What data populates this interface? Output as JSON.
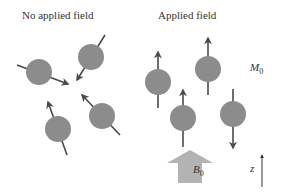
{
  "left_panel": {
    "title": "No applied field",
    "spins": [
      {
        "cx": 39,
        "cy": 72,
        "x1": 17,
        "y1": 65,
        "x2": 68,
        "y2": 84
      },
      {
        "cx": 91,
        "cy": 57,
        "x1": 105,
        "y1": 35,
        "x2": 77,
        "y2": 80
      },
      {
        "cx": 58,
        "cy": 129,
        "x1": 67,
        "y1": 155,
        "x2": 48,
        "y2": 102
      },
      {
        "cx": 102,
        "cy": 116,
        "x1": 120,
        "y1": 135,
        "x2": 82,
        "y2": 95
      }
    ]
  },
  "right_panel": {
    "title": "Applied field",
    "magnetization_label": "M",
    "magnetization_subscript": "0",
    "field_label": "B",
    "field_subscript": "0",
    "axis_label": "z",
    "spins": [
      {
        "cx": 158,
        "cy": 82,
        "x1": 158,
        "y1": 108,
        "x2": 158,
        "y2": 52
      },
      {
        "cx": 208,
        "cy": 69,
        "x1": 208,
        "y1": 95,
        "x2": 208,
        "y2": 38
      },
      {
        "cx": 183,
        "cy": 118,
        "x1": 183,
        "y1": 147,
        "x2": 183,
        "y2": 90
      },
      {
        "cx": 233,
        "cy": 114,
        "x1": 233,
        "y1": 89,
        "x2": 233,
        "y2": 148
      }
    ]
  },
  "colors": {
    "ball": "#8c8c8c",
    "arrow": "#4a4a4a",
    "field_arrow": "#b3b3b3"
  }
}
